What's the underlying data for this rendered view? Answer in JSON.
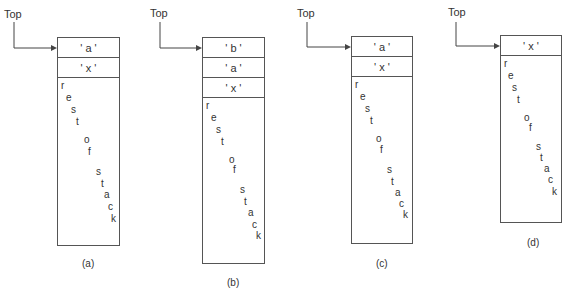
{
  "diagram": {
    "pointer_label": "Top",
    "rest_letters": [
      "r",
      "e",
      "s",
      "t",
      "o",
      "f",
      "s",
      "t",
      "a",
      "c",
      "k"
    ],
    "stacks": [
      {
        "id": "a",
        "caption": "(a)",
        "cells": [
          "' a '",
          "' x '"
        ]
      },
      {
        "id": "b",
        "caption": "(b)",
        "cells": [
          "' b '",
          "' a '",
          "' x '"
        ]
      },
      {
        "id": "c",
        "caption": "(c)",
        "cells": [
          "' a '",
          "' x '"
        ]
      },
      {
        "id": "d",
        "caption": "(d)",
        "cells": [
          "' x '"
        ]
      }
    ]
  }
}
